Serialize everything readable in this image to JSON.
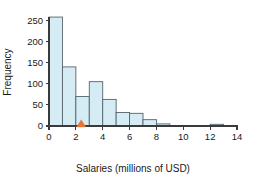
{
  "chart_data": {
    "type": "bar",
    "title": "",
    "subtitle": "",
    "xlabel": "Salaries (millions of USD)",
    "ylabel": "Frequency",
    "xlim": [
      0,
      14
    ],
    "ylim": [
      0,
      270
    ],
    "grid": false,
    "legend": null,
    "bin_width": 1,
    "bin_starts": [
      0,
      1,
      2,
      3,
      4,
      5,
      6,
      7,
      8,
      9,
      10,
      11,
      12,
      13
    ],
    "categories": [
      "0-1",
      "1-2",
      "2-3",
      "3-4",
      "4-5",
      "5-6",
      "6-7",
      "7-8",
      "8-9",
      "9-10",
      "10-11",
      "11-12",
      "12-13",
      "13-14"
    ],
    "values": [
      258,
      140,
      70,
      105,
      63,
      32,
      30,
      15,
      5,
      1,
      0,
      0,
      4,
      1
    ],
    "xticks": [
      0,
      2,
      4,
      6,
      8,
      10,
      12,
      14
    ],
    "xticklabels": [
      "0",
      "2",
      "4",
      "6",
      "8",
      "10",
      "12",
      "14"
    ],
    "yticks": [
      0,
      50,
      100,
      150,
      200,
      250
    ],
    "yticklabels": [
      "0",
      "50",
      "100",
      "150",
      "200",
      "250"
    ],
    "annotations": [
      {
        "name": "marker-triangle",
        "shape": "triangle-up",
        "x": 2.4,
        "y": 0,
        "color": "#e8743b",
        "label": ""
      }
    ],
    "colors": {
      "bar_fill": "#d5ecf4",
      "bar_edge": "#55636b",
      "axis": "#3a3a3a",
      "text": "#1a1a1a",
      "marker": "#e8743b",
      "background": "#ffffff"
    }
  }
}
